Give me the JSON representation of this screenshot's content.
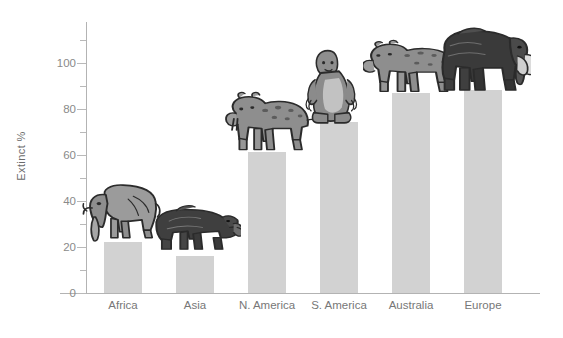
{
  "chart_data": {
    "type": "bar",
    "title": "",
    "xlabel": "",
    "ylabel": "Extinct %",
    "categories": [
      "Africa",
      "Asia",
      "N. America",
      "S. America",
      "Australia",
      "Europe"
    ],
    "values": [
      22,
      16,
      61,
      74,
      87,
      88
    ],
    "ylim": [
      0,
      115
    ],
    "ytick_labels": [
      "0",
      "20",
      "40",
      "60",
      "80",
      "100"
    ],
    "ytick_values": [
      0,
      20,
      40,
      60,
      80,
      100
    ],
    "yminor_tick_values": [
      10,
      30,
      50,
      70,
      90,
      110
    ],
    "grid": false,
    "legend": "none",
    "bar_color": "#d2d2d2",
    "axis_color": "#b3b3b3",
    "tick_label_color": "#8a8a8a",
    "category_label_color": "#777777",
    "annotations": [
      {
        "category": "Africa",
        "icon": "elephant-illustration"
      },
      {
        "category": "Asia",
        "icon": "rhinoceros-illustration"
      },
      {
        "category": "N. America",
        "icon": "sabertooth-cat-illustration"
      },
      {
        "category": "S. America",
        "icon": "giant-ground-sloth-illustration"
      },
      {
        "category": "Australia",
        "icon": "marsupial-lion-illustration"
      },
      {
        "category": "Europe",
        "icon": "woolly-mammoth-illustration"
      }
    ]
  }
}
